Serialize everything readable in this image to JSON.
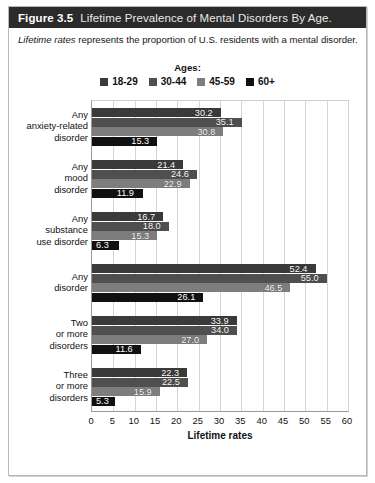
{
  "figure": {
    "number": "Figure 3.5",
    "title": "Lifetime Prevalence of Mental Disorders By Age.",
    "subtitle_italic": "Lifetime rates",
    "subtitle_rest": " represents the proportion of U.S. residents with a mental disorder."
  },
  "legend": {
    "title": "Ages:",
    "entries": [
      {
        "label": "18-29",
        "color": "#3a3a3a"
      },
      {
        "label": "30-44",
        "color": "#4f4f4f"
      },
      {
        "label": "45-59",
        "color": "#7d7d7d"
      },
      {
        "label": "60+",
        "color": "#111111"
      }
    ]
  },
  "chart_data": {
    "type": "bar",
    "orientation": "horizontal",
    "title": "Lifetime Prevalence of Mental Disorders By Age.",
    "xlabel": "Lifetime rates",
    "ylabel": "",
    "xlim": [
      0,
      60
    ],
    "xticks": [
      0,
      5,
      10,
      15,
      20,
      25,
      30,
      35,
      40,
      45,
      50,
      55,
      60
    ],
    "grid": true,
    "legend_position": "top",
    "categories": [
      "Any anxiety-related disorder",
      "Any mood disorder",
      "Any substance use disorder",
      "Any disorder",
      "Two or more disorders",
      "Three or more disorders"
    ],
    "category_lines": [
      [
        "Any",
        "anxiety-related",
        "disorder"
      ],
      [
        "Any",
        "mood",
        "disorder"
      ],
      [
        "Any",
        "substance",
        "use disorder"
      ],
      [
        "Any",
        "disorder"
      ],
      [
        "Two",
        "or more",
        "disorders"
      ],
      [
        "Three",
        "or more",
        "disorders"
      ]
    ],
    "series": [
      {
        "name": "18-29",
        "color": "#3a3a3a",
        "values": [
          30.2,
          21.4,
          16.7,
          52.4,
          33.9,
          22.3
        ]
      },
      {
        "name": "30-44",
        "color": "#4f4f4f",
        "values": [
          35.1,
          24.6,
          18.0,
          55.0,
          34.0,
          22.5
        ]
      },
      {
        "name": "45-59",
        "color": "#7d7d7d",
        "values": [
          30.8,
          22.9,
          15.3,
          46.5,
          27.0,
          15.9
        ]
      },
      {
        "name": "60+",
        "color": "#111111",
        "values": [
          15.3,
          11.9,
          6.3,
          26.1,
          11.6,
          5.3
        ]
      }
    ],
    "value_labels": [
      [
        "30.2",
        "35.1",
        "30.8",
        "15.3"
      ],
      [
        "21.4",
        "24.6",
        "22.9",
        "11.9"
      ],
      [
        "16.7",
        "18.0",
        "15.3",
        "6.3"
      ],
      [
        "52.4",
        "55.0",
        "46.5",
        "26.1"
      ],
      [
        "33.9",
        "34.0",
        "27.0",
        "11.6"
      ],
      [
        "22.3",
        "22.5",
        "15.9",
        "5.3"
      ]
    ]
  }
}
